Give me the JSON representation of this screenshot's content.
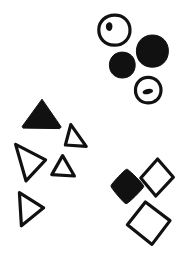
{
  "image": {
    "title": "Hand-drawn shape clusters",
    "style": "hand-drawn ink line art",
    "background_color": "#ffffff",
    "ink_color": "#111111",
    "width": 190,
    "height": 256
  },
  "clusters": [
    {
      "id": "circle-cluster",
      "label": "Circles",
      "region": "top-right",
      "count": 4,
      "filled_count": 2,
      "outlined_count": 2,
      "shapes": [
        {
          "name": "outlined-circle-with-dot",
          "shape": "circle",
          "fill": "outlined",
          "cx": 114,
          "cy": 30,
          "r": 15,
          "inner_mark": "small-dark-blob-upper-left"
        },
        {
          "name": "filled-circle-large",
          "shape": "circle",
          "fill": "filled",
          "cx": 152,
          "cy": 51,
          "r": 16,
          "inner_mark": "none"
        },
        {
          "name": "filled-circle-small",
          "shape": "circle",
          "fill": "filled",
          "cx": 122,
          "cy": 65,
          "r": 13,
          "inner_mark": "none"
        },
        {
          "name": "outlined-circle-with-dash",
          "shape": "circle",
          "fill": "outlined",
          "cx": 148,
          "cy": 90,
          "r": 13,
          "inner_mark": "small-horizontal-dash-center"
        }
      ]
    },
    {
      "id": "triangle-cluster",
      "label": "Triangles",
      "region": "left-center",
      "count": 5,
      "filled_count": 1,
      "outlined_count": 4,
      "shapes": [
        {
          "name": "filled-triangle-up",
          "shape": "triangle",
          "fill": "filled",
          "orientation": "up",
          "cx": 41,
          "cy": 115,
          "size": 30
        },
        {
          "name": "outlined-triangle-up-right",
          "shape": "triangle",
          "fill": "outlined",
          "orientation": "up",
          "cx": 75,
          "cy": 136,
          "size": 23
        },
        {
          "name": "outlined-triangle-right-large",
          "shape": "triangle",
          "fill": "outlined",
          "orientation": "right",
          "cx": 30,
          "cy": 162,
          "size": 31
        },
        {
          "name": "outlined-triangle-up-small",
          "shape": "triangle",
          "fill": "outlined",
          "orientation": "up",
          "cx": 63,
          "cy": 166,
          "size": 21
        },
        {
          "name": "outlined-triangle-right-small",
          "shape": "triangle",
          "fill": "outlined",
          "orientation": "right",
          "cx": 29,
          "cy": 209,
          "size": 26
        }
      ]
    },
    {
      "id": "diamond-cluster",
      "label": "Diamonds",
      "region": "bottom-right",
      "count": 3,
      "filled_count": 1,
      "outlined_count": 2,
      "shapes": [
        {
          "name": "outlined-diamond-upper",
          "shape": "diamond",
          "fill": "outlined",
          "cx": 157,
          "cy": 178,
          "size": 21,
          "rotation_deg": -8
        },
        {
          "name": "filled-diamond",
          "shape": "diamond",
          "fill": "filled",
          "cx": 127,
          "cy": 189,
          "size": 20,
          "rotation_deg": 5
        },
        {
          "name": "outlined-diamond-lower",
          "shape": "diamond",
          "fill": "outlined",
          "cx": 148,
          "cy": 223,
          "size": 22,
          "rotation_deg": 7
        }
      ]
    }
  ],
  "summary": {
    "total_shapes": 12,
    "total_filled": 4,
    "total_outlined": 8
  }
}
